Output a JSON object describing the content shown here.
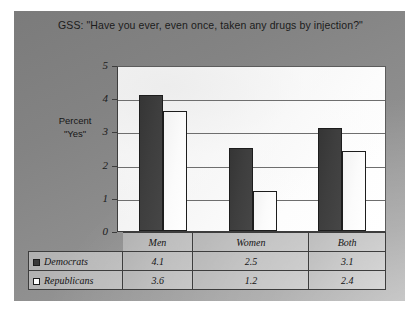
{
  "chart_data": {
    "type": "bar",
    "title": "GSS: \"Have you ever, even once, taken any drugs by injection?\"",
    "xlabel": "",
    "ylabel": "Percent \"Yes\"",
    "ylabel_lines": [
      "Percent",
      "\"Yes\""
    ],
    "categories": [
      "Men",
      "Women",
      "Both"
    ],
    "series": [
      {
        "name": "Democrats",
        "values": [
          4.1,
          2.5,
          3.1
        ],
        "color": "#3a3a3a",
        "swatch": "filled-dark-square"
      },
      {
        "name": "Republicans",
        "values": [
          3.6,
          1.2,
          2.4
        ],
        "color": "#ffffff",
        "swatch": "outlined-white-square"
      }
    ],
    "ylim": [
      0,
      5
    ],
    "yticks": [
      0,
      1,
      2,
      3,
      4,
      5
    ],
    "ytick_labels": [
      "0",
      "1",
      "2",
      "3",
      "4",
      "5"
    ],
    "grid": true,
    "grid_axis": "y",
    "legend_position": "data-table-left-column",
    "data_table_visible": true,
    "value_labels": {
      "Democrats": [
        "4.1",
        "2.5",
        "3.1"
      ],
      "Republicans": [
        "3.6",
        "1.2",
        "2.4"
      ]
    }
  },
  "panel": {
    "background_color": "#8c8c8c",
    "plot_background_color": "#f7f7f7",
    "axis_color": "#3d3d3d",
    "gridline_color": "#6e6e6e"
  }
}
